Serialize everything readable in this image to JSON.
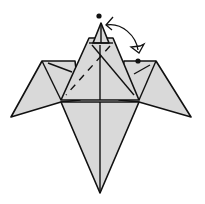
{
  "diagram": {
    "colors": {
      "paper": "#d9d9d9",
      "line": "#111111",
      "background": "#ffffff"
    },
    "markers": [
      {
        "name": "top-dot",
        "x": 99,
        "y": 16
      },
      {
        "name": "right-dot",
        "x": 138,
        "y": 61
      }
    ],
    "arrow": {
      "type": "fold-arrow",
      "from": "right-dot",
      "to": "top-dot",
      "direction": "valley fold up"
    }
  }
}
